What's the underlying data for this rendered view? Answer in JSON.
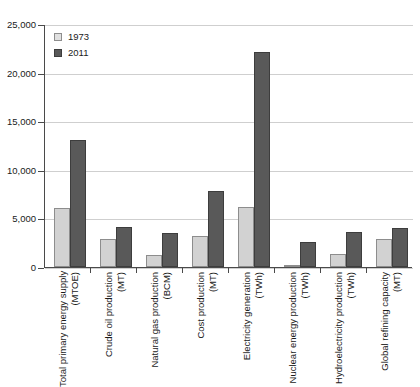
{
  "chart_data": {
    "type": "bar",
    "title": "",
    "subtitle": "",
    "xlabel": "",
    "ylabel": "",
    "ylim": [
      0,
      25000
    ],
    "yticks": [
      0,
      5000,
      10000,
      15000,
      20000,
      25000
    ],
    "ytick_labels": [
      "0",
      "5,000",
      "10,000",
      "15,000",
      "20,000",
      "25,000"
    ],
    "grid": true,
    "legend_position": "top-left",
    "categories": [
      "Total primary energy supply (MTOE)",
      "Crude oil production (MT)",
      "Natural gas production (BCM)",
      "Cost production (MT)",
      "Electricity generation (TWh)",
      "Nuclear energy production (TWh)",
      "Hydroelectricity production (TWh)",
      "Global refining capacity (MT)"
    ],
    "category_lines": [
      {
        "line1": "Total primary energy supply",
        "line2": "(MTOE)"
      },
      {
        "line1": "Crude oil production",
        "line2": "(MT)"
      },
      {
        "line1": "Natural gas production",
        "line2": "(BCM)"
      },
      {
        "line1": "Cost production",
        "line2": "(MT)"
      },
      {
        "line1": "Electricity generation",
        "line2": "(TWh)"
      },
      {
        "line1": "Nuclear energy production",
        "line2": "(TWh)"
      },
      {
        "line1": "Hydroelectricity production",
        "line2": "(TWh)"
      },
      {
        "line1": "Global refining capacity",
        "line2": "(MT)"
      }
    ],
    "series": [
      {
        "name": "1973",
        "color": "#d2d2d2",
        "values": [
          6100,
          2900,
          1250,
          3150,
          6200,
          200,
          1350,
          2900
        ]
      },
      {
        "name": "2011",
        "color": "#595959",
        "values": [
          13100,
          4150,
          3450,
          7800,
          22150,
          2600,
          3650,
          4050
        ]
      }
    ]
  },
  "legend": {
    "entries": [
      {
        "label": "1973"
      },
      {
        "label": "2011"
      }
    ]
  }
}
